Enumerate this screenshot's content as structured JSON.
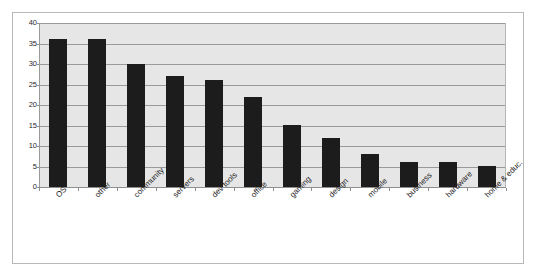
{
  "chart_data": {
    "type": "bar",
    "title": "",
    "subtitle": "",
    "xlabel": "",
    "ylabel": "",
    "categories": [
      "OS",
      "other",
      "community",
      "servers",
      "dev tools",
      "office",
      "gaming",
      "design",
      "mobile",
      "business",
      "hardware",
      "home & educ."
    ],
    "values": [
      36,
      36,
      30,
      27,
      26,
      22,
      15,
      12,
      8,
      6,
      6,
      5
    ],
    "ylim": [
      0,
      40
    ],
    "ytick_labels": [
      "40",
      "35",
      "30",
      "25",
      "20",
      "15",
      "10",
      "5",
      "0"
    ],
    "ytick_values": [
      40,
      35,
      30,
      25,
      20,
      15,
      10,
      5,
      0
    ],
    "grid": true,
    "grid_orientation": "horizontal",
    "legend": false,
    "legend_position": "none",
    "bar_color": "#1c1c1c",
    "plot_background_color": "#e6e6e6",
    "gridline_color": "#9a9a9a",
    "frame_border_color": "#b9b9b9",
    "xtick_label_rotation": -45
  }
}
